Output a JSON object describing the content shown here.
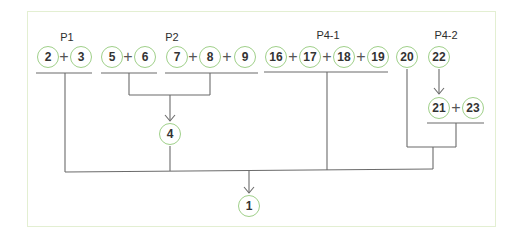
{
  "diagram": {
    "colors": {
      "node_border": "#9fd089",
      "line": "#666666",
      "frame_border": "#e3efd2"
    },
    "groups": [
      {
        "label": "P1",
        "x": 67,
        "y": 37
      },
      {
        "label": "P2",
        "x": 172,
        "y": 37
      },
      {
        "label": "P4-1",
        "x": 328,
        "y": 35
      },
      {
        "label": "P4-2",
        "x": 446,
        "y": 35
      }
    ],
    "nodes": [
      {
        "id": "2",
        "label": "2",
        "x": 48,
        "y": 57
      },
      {
        "id": "3",
        "label": "3",
        "x": 81,
        "y": 57
      },
      {
        "id": "5",
        "label": "5",
        "x": 112,
        "y": 57
      },
      {
        "id": "6",
        "label": "6",
        "x": 145,
        "y": 57
      },
      {
        "id": "7",
        "label": "7",
        "x": 177,
        "y": 57
      },
      {
        "id": "8",
        "label": "8",
        "x": 210,
        "y": 57
      },
      {
        "id": "9",
        "label": "9",
        "x": 245,
        "y": 57
      },
      {
        "id": "16",
        "label": "16",
        "x": 276,
        "y": 57
      },
      {
        "id": "17",
        "label": "17",
        "x": 310,
        "y": 57
      },
      {
        "id": "18",
        "label": "18",
        "x": 344,
        "y": 57
      },
      {
        "id": "19",
        "label": "19",
        "x": 378,
        "y": 57
      },
      {
        "id": "20",
        "label": "20",
        "x": 407,
        "y": 57
      },
      {
        "id": "22",
        "label": "22",
        "x": 439,
        "y": 57
      },
      {
        "id": "21",
        "label": "21",
        "x": 439,
        "y": 108
      },
      {
        "id": "23",
        "label": "23",
        "x": 473,
        "y": 108
      },
      {
        "id": "4",
        "label": "4",
        "x": 170,
        "y": 134
      },
      {
        "id": "1",
        "label": "1",
        "x": 249,
        "y": 206
      }
    ],
    "plus_signs": [
      {
        "x": 64,
        "y": 57
      },
      {
        "x": 128,
        "y": 57
      },
      {
        "x": 193,
        "y": 57
      },
      {
        "x": 227,
        "y": 57
      },
      {
        "x": 293,
        "y": 57
      },
      {
        "x": 327,
        "y": 57
      },
      {
        "x": 361,
        "y": 57
      },
      {
        "x": 456,
        "y": 108
      }
    ],
    "edges": [
      {
        "from": "5+6",
        "to": "4"
      },
      {
        "from": "7+8+9",
        "to": "4"
      },
      {
        "from": "22",
        "to": "21+23"
      },
      {
        "from": "2+3",
        "to": "1"
      },
      {
        "from": "4",
        "to": "1"
      },
      {
        "from": "16+17+18+19",
        "to": "1"
      },
      {
        "from": "20",
        "to": "1"
      },
      {
        "from": "21+23",
        "to": "1"
      }
    ]
  }
}
